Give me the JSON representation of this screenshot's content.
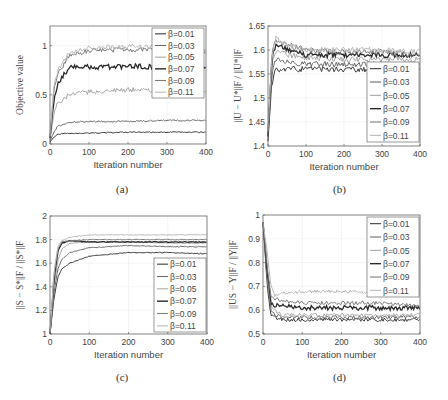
{
  "figure": {
    "captions": [
      "(a)",
      "(b)",
      "(c)",
      "(d)"
    ]
  },
  "legend_labels": [
    "β=0.01",
    "β=0.03",
    "β=0.05",
    "β=0.07",
    "β=0.09",
    "β=0.11"
  ],
  "series_colors": [
    "#3a3a3a",
    "#6a6a6a",
    "#a8a8a8",
    "#2a2a2a",
    "#7c7c7c",
    "#b8b8b8"
  ],
  "chart_data": [
    {
      "id": "a",
      "type": "line",
      "title": "",
      "xlabel": "Iteration number",
      "ylabel": "Objective value",
      "xlim": [
        0,
        400
      ],
      "ylim": [
        0,
        1.2
      ],
      "xticks": [
        0,
        100,
        200,
        300,
        400
      ],
      "yticks": [
        0,
        0.5,
        1
      ],
      "grid": true,
      "legend_position": "upper right",
      "x": [
        0,
        10,
        20,
        50,
        100,
        200,
        300,
        400
      ],
      "series": [
        {
          "name": "β=0.01",
          "values": [
            0.02,
            0.07,
            0.1,
            0.11,
            0.11,
            0.12,
            0.12,
            0.12
          ]
        },
        {
          "name": "β=0.03",
          "values": [
            0.03,
            0.12,
            0.18,
            0.22,
            0.23,
            0.23,
            0.24,
            0.24
          ]
        },
        {
          "name": "β=0.05",
          "values": [
            0.05,
            0.3,
            0.42,
            0.5,
            0.53,
            0.55,
            0.55,
            0.54
          ]
        },
        {
          "name": "β=0.07",
          "values": [
            0.06,
            0.45,
            0.62,
            0.78,
            0.78,
            0.79,
            0.78,
            0.77
          ]
        },
        {
          "name": "β=0.09",
          "values": [
            0.07,
            0.55,
            0.72,
            0.9,
            0.95,
            0.96,
            0.96,
            0.95
          ]
        },
        {
          "name": "β=0.11",
          "values": [
            0.08,
            0.58,
            0.75,
            0.93,
            0.98,
            0.99,
            0.98,
            0.97
          ]
        }
      ]
    },
    {
      "id": "b",
      "type": "line",
      "title": "",
      "xlabel": "Iteration number",
      "ylabel": "||U − U*||F / ||U*||F",
      "xlim": [
        0,
        400
      ],
      "ylim": [
        1.4,
        1.65
      ],
      "xticks": [
        0,
        100,
        200,
        300,
        400
      ],
      "yticks": [
        1.4,
        1.45,
        1.5,
        1.55,
        1.6,
        1.65
      ],
      "grid": true,
      "legend_position": "lower right",
      "x": [
        0,
        10,
        20,
        50,
        100,
        200,
        300,
        400
      ],
      "series": [
        {
          "name": "β=0.01",
          "values": [
            1.41,
            1.53,
            1.56,
            1.56,
            1.56,
            1.56,
            1.56,
            1.56
          ]
        },
        {
          "name": "β=0.03",
          "values": [
            1.42,
            1.55,
            1.58,
            1.575,
            1.57,
            1.57,
            1.57,
            1.57
          ]
        },
        {
          "name": "β=0.05",
          "values": [
            1.42,
            1.57,
            1.6,
            1.59,
            1.585,
            1.58,
            1.58,
            1.58
          ]
        },
        {
          "name": "β=0.07",
          "values": [
            1.42,
            1.58,
            1.61,
            1.6,
            1.59,
            1.59,
            1.59,
            1.59
          ]
        },
        {
          "name": "β=0.09",
          "values": [
            1.43,
            1.59,
            1.62,
            1.61,
            1.6,
            1.595,
            1.595,
            1.59
          ]
        },
        {
          "name": "β=0.11",
          "values": [
            1.43,
            1.59,
            1.625,
            1.61,
            1.6,
            1.6,
            1.6,
            1.595
          ]
        }
      ]
    },
    {
      "id": "c",
      "type": "line",
      "title": "",
      "xlabel": "Iteration number",
      "ylabel": "||S − S*||F / ||S*||F",
      "xlim": [
        0,
        400
      ],
      "ylim": [
        1,
        2
      ],
      "xticks": [
        0,
        100,
        200,
        300,
        400
      ],
      "yticks": [
        1,
        1.2,
        1.4,
        1.6,
        1.8,
        2
      ],
      "grid": true,
      "legend_position": "lower right",
      "x": [
        0,
        10,
        20,
        30,
        50,
        100,
        200,
        300,
        400
      ],
      "series": [
        {
          "name": "β=0.01",
          "values": [
            1.0,
            1.3,
            1.48,
            1.55,
            1.6,
            1.66,
            1.69,
            1.69,
            1.68
          ]
        },
        {
          "name": "β=0.03",
          "values": [
            1.0,
            1.35,
            1.55,
            1.63,
            1.69,
            1.73,
            1.75,
            1.74,
            1.74
          ]
        },
        {
          "name": "β=0.05",
          "values": [
            1.0,
            1.4,
            1.62,
            1.72,
            1.77,
            1.78,
            1.78,
            1.77,
            1.77
          ]
        },
        {
          "name": "β=0.07",
          "values": [
            1.0,
            1.45,
            1.7,
            1.77,
            1.79,
            1.78,
            1.78,
            1.78,
            1.78
          ]
        },
        {
          "name": "β=0.09",
          "values": [
            1.0,
            1.5,
            1.72,
            1.78,
            1.79,
            1.8,
            1.8,
            1.8,
            1.8
          ]
        },
        {
          "name": "β=0.11",
          "values": [
            1.0,
            1.52,
            1.74,
            1.79,
            1.82,
            1.84,
            1.84,
            1.84,
            1.84
          ]
        }
      ]
    },
    {
      "id": "d",
      "type": "line",
      "title": "",
      "xlabel": "Iteration number",
      "ylabel": "||US − Y||F / ||Y||F",
      "xlim": [
        0,
        400
      ],
      "ylim": [
        0.5,
        1
      ],
      "xticks": [
        0,
        100,
        200,
        300,
        400
      ],
      "yticks": [
        0.5,
        0.6,
        0.7,
        0.8,
        0.9,
        1
      ],
      "grid": true,
      "legend_position": "upper right",
      "x": [
        0,
        10,
        20,
        30,
        50,
        100,
        200,
        300,
        400
      ],
      "series": [
        {
          "name": "β=0.01",
          "values": [
            0.97,
            0.72,
            0.58,
            0.57,
            0.56,
            0.56,
            0.56,
            0.56,
            0.56
          ]
        },
        {
          "name": "β=0.03",
          "values": [
            0.97,
            0.74,
            0.6,
            0.58,
            0.57,
            0.57,
            0.57,
            0.57,
            0.57
          ]
        },
        {
          "name": "β=0.05",
          "values": [
            0.97,
            0.76,
            0.62,
            0.6,
            0.58,
            0.58,
            0.58,
            0.58,
            0.58
          ]
        },
        {
          "name": "β=0.07",
          "values": [
            0.97,
            0.78,
            0.63,
            0.62,
            0.62,
            0.61,
            0.61,
            0.61,
            0.61
          ]
        },
        {
          "name": "β=0.09",
          "values": [
            0.97,
            0.8,
            0.66,
            0.65,
            0.64,
            0.63,
            0.63,
            0.63,
            0.62
          ]
        },
        {
          "name": "β=0.11",
          "values": [
            0.97,
            0.85,
            0.7,
            0.66,
            0.67,
            0.68,
            0.68,
            0.67,
            0.67
          ]
        }
      ]
    }
  ]
}
